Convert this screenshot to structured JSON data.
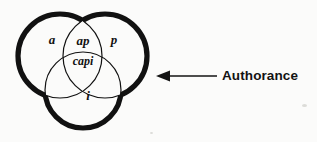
{
  "figure": {
    "type": "venn-diagram-3-set",
    "background_color": "#fbfbfa",
    "stroke_color": "#111111",
    "outer_stroke_width": 5,
    "inner_stroke_width": 1.2
  },
  "venn": {
    "circles": [
      {
        "name": "set-a",
        "cx": 60,
        "cy": 56,
        "r": 42
      },
      {
        "name": "set-p",
        "cx": 105,
        "cy": 56,
        "r": 42
      },
      {
        "name": "set-i",
        "cx": 83,
        "cy": 90,
        "r": 38
      }
    ],
    "regions": [
      {
        "id": "region-a",
        "label": "a",
        "x": 52,
        "y": 41,
        "font_size": 13
      },
      {
        "id": "region-ap",
        "label": "ap",
        "x": 83,
        "y": 42,
        "font_size": 13
      },
      {
        "id": "region-p",
        "label": "p",
        "x": 114,
        "y": 41,
        "font_size": 13
      },
      {
        "id": "region-capi",
        "label": "capi",
        "x": 83,
        "y": 62,
        "font_size": 12
      },
      {
        "id": "region-i",
        "label": "i",
        "x": 88,
        "y": 97,
        "font_size": 13
      }
    ]
  },
  "callout": {
    "label": "Authorance",
    "arrow": {
      "name": "left-arrow",
      "tip_x": 157,
      "tail_x": 217,
      "y": 76,
      "head_length": 11,
      "head_half_height": 5.5,
      "shaft_width": 1.6
    },
    "label_x": 222,
    "label_y": 76
  }
}
